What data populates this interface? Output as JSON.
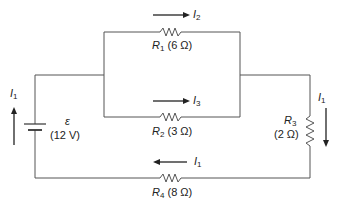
{
  "diagram": {
    "type": "circuit",
    "wire_color": "#555555",
    "battery": {
      "symbol": "ε",
      "value": "(12 V)"
    },
    "resistors": [
      {
        "name": "R",
        "sub": "1",
        "value": "(6 Ω)"
      },
      {
        "name": "R",
        "sub": "2",
        "value": "(3 Ω)"
      },
      {
        "name": "R",
        "sub": "3",
        "value": "(2 Ω)"
      },
      {
        "name": "R",
        "sub": "4",
        "value": "(8 Ω)"
      }
    ],
    "currents": [
      {
        "name": "I",
        "sub": "2",
        "location": "top branch, rightward"
      },
      {
        "name": "I",
        "sub": "3",
        "location": "middle branch, rightward"
      },
      {
        "name": "I",
        "sub": "1",
        "location": "left side, upward"
      },
      {
        "name": "I",
        "sub": "1",
        "location": "right side, downward"
      },
      {
        "name": "I",
        "sub": "1",
        "location": "bottom, leftward"
      }
    ]
  }
}
